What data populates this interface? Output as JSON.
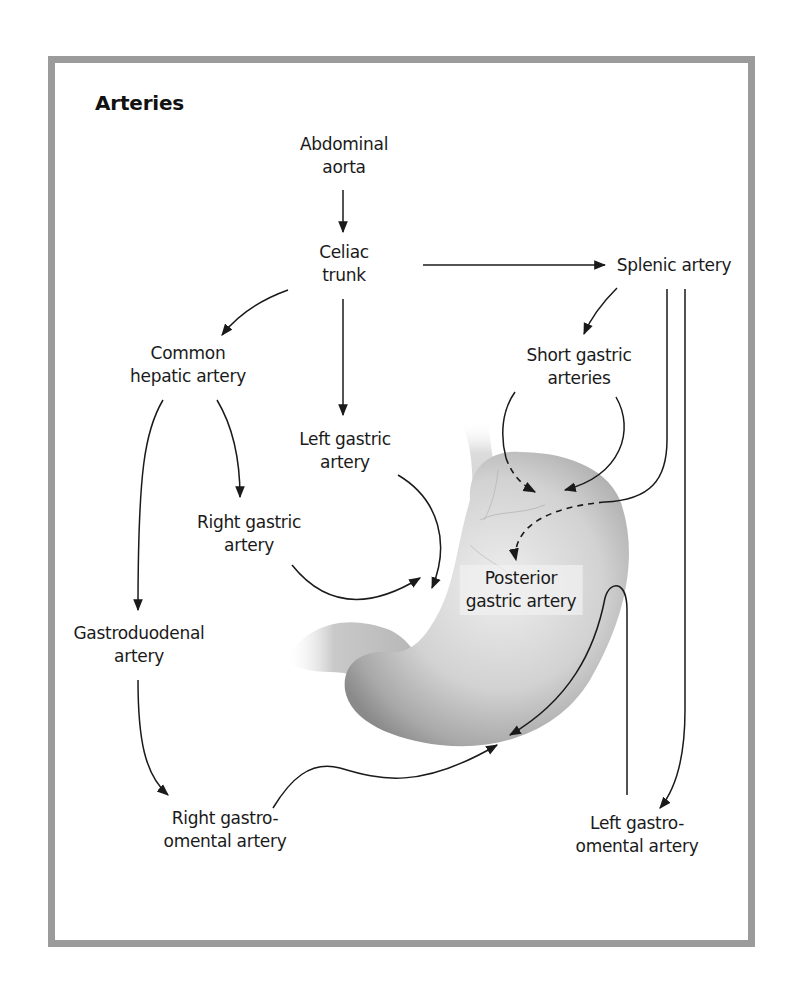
{
  "title": "Arteries",
  "nodes": {
    "abdominal_aorta": [
      "Abdominal",
      "aorta"
    ],
    "celiac_trunk": [
      "Celiac",
      "trunk"
    ],
    "splenic_artery": [
      "Splenic artery"
    ],
    "common_hepatic": [
      "Common",
      "hepatic artery"
    ],
    "short_gastric": [
      "Short gastric",
      "arteries"
    ],
    "left_gastric": [
      "Left gastric",
      "artery"
    ],
    "right_gastric": [
      "Right gastric",
      "artery"
    ],
    "posterior_gastric": [
      "Posterior",
      "gastric artery"
    ],
    "gastroduodenal": [
      "Gastroduodenal",
      "artery"
    ],
    "right_gastroomental": [
      "Right gastro-",
      "omental artery"
    ],
    "left_gastroomental": [
      "Left gastro-",
      "omental artery"
    ]
  },
  "edges": [
    {
      "from": "Abdominal aorta",
      "to": "Celiac trunk"
    },
    {
      "from": "Celiac trunk",
      "to": "Splenic artery"
    },
    {
      "from": "Celiac trunk",
      "to": "Common hepatic artery"
    },
    {
      "from": "Celiac trunk",
      "to": "Left gastric artery"
    },
    {
      "from": "Splenic artery",
      "to": "Short gastric arteries"
    },
    {
      "from": "Splenic artery",
      "to": "Posterior gastric artery",
      "style": "dashed"
    },
    {
      "from": "Splenic artery",
      "to": "Left gastro-omental artery"
    },
    {
      "from": "Common hepatic artery",
      "to": "Right gastric artery"
    },
    {
      "from": "Common hepatic artery",
      "to": "Gastroduodenal artery"
    },
    {
      "from": "Gastroduodenal artery",
      "to": "Right gastro-omental artery"
    },
    {
      "from": "Short gastric arteries",
      "to": "Stomach fundus"
    },
    {
      "from": "Left gastric artery",
      "to": "Stomach lesser curvature"
    },
    {
      "from": "Right gastric artery",
      "to": "Stomach lesser curvature"
    },
    {
      "from": "Right gastro-omental artery",
      "to": "Stomach greater curvature"
    },
    {
      "from": "Left gastro-omental artery",
      "to": "Stomach greater curvature"
    }
  ],
  "colors": {
    "frame": "#9b9b9b",
    "line": "#1a1a1a",
    "stomach": "#c8c8c8"
  }
}
